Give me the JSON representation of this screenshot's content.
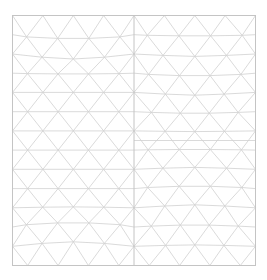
{
  "diagram": {
    "type": "triangular-mesh",
    "line_color": "#d0d0d0",
    "frame_color": "#c4c4c4",
    "panels": [
      {
        "name": "left-panel",
        "columns": 6,
        "rows": 13,
        "pattern": "structured-with-distortion",
        "distortion": "top-and-bottom-arch"
      },
      {
        "name": "right-panel",
        "columns": 6,
        "rows": 13,
        "pattern": "structured-with-distortion",
        "distortion": "two-stacked-square-cells",
        "horizontal_divider": true
      }
    ]
  }
}
